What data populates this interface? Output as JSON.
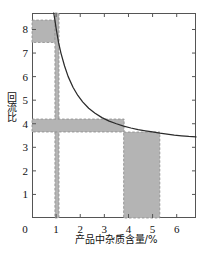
{
  "chart_data": {
    "type": "line",
    "title": "",
    "xlabel": "产品中杂质含量/%",
    "ylabel": "回流比",
    "xlim": [
      0,
      6.8
    ],
    "ylim": [
      0,
      8.7
    ],
    "xticks": [
      0,
      1,
      2,
      3,
      4,
      5,
      6
    ],
    "yticks": [
      0,
      1,
      2,
      3,
      4,
      5,
      6,
      7,
      8
    ],
    "xtick_labels": [
      "0",
      "1",
      "2",
      "3",
      "4",
      "5",
      "6"
    ],
    "ytick_labels": [
      "0",
      "1",
      "2",
      "3",
      "4",
      "5",
      "6",
      "7",
      "8"
    ],
    "grid": false,
    "legend": false,
    "curve_color": "#2b2b2b",
    "band_fill_color": "#b4b4b4",
    "band_edge_color": "#8a8a8a",
    "axis_color": "#555555",
    "series": [
      {
        "name": "回流比 vs 杂质含量",
        "asymptote": 3.38,
        "x": [
          0.9,
          0.95,
          1.0,
          1.1,
          1.2,
          1.35,
          1.5,
          1.7,
          1.9,
          2.1,
          2.35,
          2.6,
          2.9,
          3.2,
          3.5,
          3.8,
          4.1,
          4.4,
          4.7,
          5.0,
          5.3,
          5.6,
          5.9,
          6.2,
          6.5,
          6.8
        ],
        "y": [
          8.7,
          8.4,
          8.05,
          7.45,
          7.0,
          6.45,
          6.0,
          5.55,
          5.2,
          4.93,
          4.66,
          4.46,
          4.26,
          4.11,
          4.0,
          3.9,
          3.82,
          3.75,
          3.7,
          3.65,
          3.6,
          3.56,
          3.52,
          3.49,
          3.46,
          3.44
        ]
      }
    ],
    "shaded_regions": [
      {
        "name": "upper-horizontal-band",
        "orientation": "horizontal",
        "x_range": [
          0.0,
          1.05
        ],
        "y_range": [
          7.45,
          8.4
        ]
      },
      {
        "name": "vertical-band-at-1-percent",
        "orientation": "vertical",
        "x_range": [
          0.95,
          1.12
        ],
        "y_range": [
          0.0,
          8.7
        ]
      },
      {
        "name": "middle-horizontal-band",
        "orientation": "horizontal",
        "x_range": [
          0.0,
          3.82
        ],
        "y_range": [
          3.65,
          4.2
        ]
      },
      {
        "name": "right-vertical-band",
        "orientation": "vertical",
        "x_range": [
          3.8,
          5.3
        ],
        "y_range": [
          0.0,
          3.65
        ]
      }
    ]
  }
}
